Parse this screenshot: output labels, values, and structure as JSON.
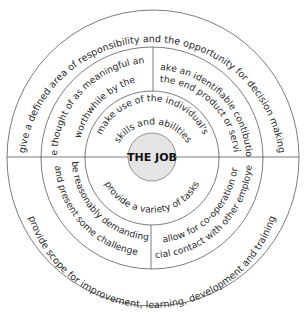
{
  "diagram": {
    "center_label": "THE JOB",
    "colors": {
      "line": "#5a5a5a",
      "text": "#2a2a2a",
      "core_fill": "#e4e4e4",
      "core_stroke": "#7a7a7a",
      "background": "#ffffff"
    },
    "outer_ring": {
      "top": "give a defined area of responsibility and the opportunity for decision making",
      "bottom": "provide scope for improvement, learning, development and training"
    },
    "middle_ring": {
      "upper_left": {
        "line1": "be thought of as meaningful and",
        "line2": "worthwhile by the"
      },
      "upper_right": {
        "line1": "make an identifiable contibution",
        "line2": "to the end product or service"
      },
      "lower_left": {
        "line1": "be reasonably demanding",
        "line2": "and present some challenge"
      },
      "lower_right": {
        "line1": "allow for co-operation or",
        "line2": "social contact with other employees"
      }
    },
    "inner_ring": {
      "top": {
        "line1": "make use of the individual's",
        "line2": "skills and abilities"
      },
      "bottom": "provide a variety of tasks"
    }
  }
}
